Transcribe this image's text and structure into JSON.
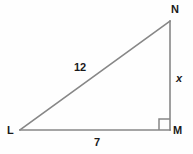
{
  "figure": {
    "type": "right-triangle-diagram",
    "background_color": "#fefefe",
    "stroke_color": "#878787",
    "text_color": "#1a1a1a",
    "stroke_width": 1.6
  },
  "vertices": [
    {
      "id": "N",
      "label": "N",
      "x": 170,
      "y": 21,
      "label_x": 171,
      "label_y": 4
    },
    {
      "id": "M",
      "label": "M",
      "x": 170,
      "y": 130,
      "label_x": 173,
      "label_y": 125
    },
    {
      "id": "L",
      "label": "L",
      "x": 20,
      "y": 130,
      "label_x": 7,
      "label_y": 125
    }
  ],
  "sides": [
    {
      "id": "LN",
      "name": "hypotenuse",
      "label": "12",
      "label_x": 74,
      "label_y": 62,
      "italic": false
    },
    {
      "id": "MN",
      "name": "vertical-leg",
      "label": "x",
      "label_x": 176,
      "label_y": 73,
      "italic": true
    },
    {
      "id": "LM",
      "name": "base-leg",
      "label": "7",
      "label_x": 94,
      "label_y": 137,
      "italic": false
    }
  ],
  "right_angle": {
    "at_vertex": "M",
    "marker": "square",
    "size": 11,
    "x": 159,
    "y": 118
  },
  "paths": {
    "base": "M 20 130 L 170 130",
    "vertical": "M 170 130 L 170 21",
    "hypotenuse": "M 20 130 L 170 21",
    "right_angle_square": "M 159 130 L 159 119 L 170 119"
  }
}
